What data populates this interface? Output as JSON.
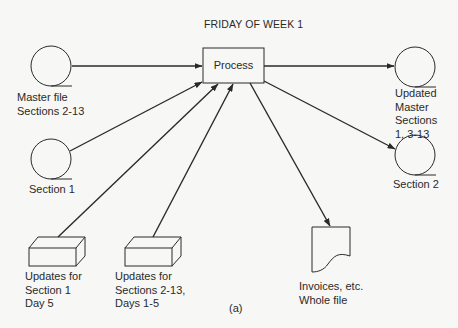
{
  "diagram": {
    "title": "FRIDAY OF WEEK 1",
    "caption": "(a)",
    "process": {
      "label": "Process"
    },
    "nodes": {
      "master_file": {
        "type": "disk-file",
        "lines": [
          "Master file",
          "Sections 2-13"
        ]
      },
      "section_1": {
        "type": "disk-file",
        "lines": [
          "Section 1"
        ]
      },
      "updates_section_1": {
        "type": "card-deck",
        "lines": [
          "Updates for",
          "Section 1",
          "Day 5"
        ]
      },
      "updates_sections_2_13": {
        "type": "card-deck",
        "lines": [
          "Updates for",
          "Sections 2-13,",
          "Days 1-5"
        ]
      },
      "updated_master": {
        "type": "disk-file",
        "lines": [
          "Updated",
          "Master",
          "Sections",
          "1, 3-13"
        ]
      },
      "section_2": {
        "type": "disk-file",
        "lines": [
          "Section 2"
        ]
      },
      "invoices": {
        "type": "document",
        "lines": [
          "Invoices, etc.",
          "Whole file"
        ]
      }
    },
    "edges": [
      {
        "from": "master_file",
        "to": "process"
      },
      {
        "from": "section_1",
        "to": "process"
      },
      {
        "from": "updates_section_1",
        "to": "process"
      },
      {
        "from": "updates_sections_2_13",
        "to": "process"
      },
      {
        "from": "process",
        "to": "updated_master"
      },
      {
        "from": "process",
        "to": "section_2"
      },
      {
        "from": "process",
        "to": "invoices"
      }
    ],
    "colors": {
      "ink": "#2a2a2a",
      "background": "#f7f7f5"
    }
  }
}
